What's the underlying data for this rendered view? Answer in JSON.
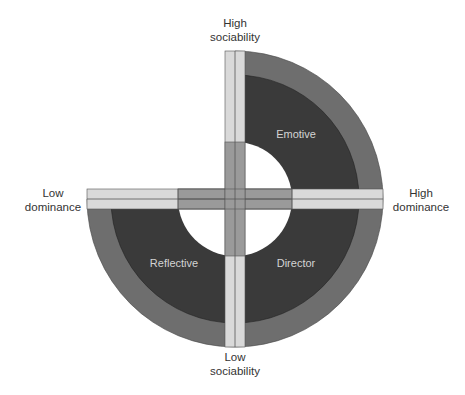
{
  "diagram": {
    "title": "",
    "type": "social styles quadrant diagram",
    "axes": {
      "top": {
        "line1": "High",
        "line2": "sociability"
      },
      "bottom": {
        "line1": "Low",
        "line2": "sociability"
      },
      "left": {
        "line1": "Low",
        "line2": "dominance"
      },
      "right": {
        "line1": "High",
        "line2": "dominance"
      }
    },
    "quadrants": [
      {
        "position": "upper-right",
        "label": "Emotive"
      },
      {
        "position": "lower-left",
        "label": "Reflective"
      },
      {
        "position": "lower-right",
        "label": "Director"
      }
    ],
    "empty_quadrant": "upper-left",
    "colors": {
      "outer_ring": "#6e6e6e",
      "inner_band": "#3a3a3a",
      "axis_light": "#d9d9d9",
      "axis_mid": "#9a9a9a",
      "quadrant_text": "#d4d4d4",
      "axis_text": "#333333"
    }
  }
}
